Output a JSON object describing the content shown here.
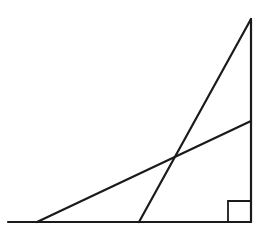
{
  "diagram": {
    "type": "geometry",
    "colors": {
      "stroke": "#1a1a1a",
      "background": "#ffffff"
    },
    "points": {
      "base_left_end": [
        8,
        222
      ],
      "right_angle_vertex": [
        251,
        222
      ],
      "top_vertex": [
        251,
        19
      ],
      "steep_line_base_point": [
        139,
        222
      ],
      "shallow_line_base_point": [
        37,
        222
      ],
      "shallow_line_side_point": [
        251,
        121
      ],
      "intersection": [
        175,
        157
      ]
    },
    "segments": [
      {
        "name": "baseline",
        "from": [
          8,
          222
        ],
        "to": [
          251,
          222
        ]
      },
      {
        "name": "vertical-side",
        "from": [
          251,
          19
        ],
        "to": [
          251,
          222
        ]
      },
      {
        "name": "steep-line",
        "from": [
          139,
          222
        ],
        "to": [
          251,
          19
        ]
      },
      {
        "name": "shallow-line",
        "from": [
          37,
          222
        ],
        "to": [
          251,
          121
        ]
      }
    ],
    "right_angle_marker": {
      "corner": [
        251,
        222
      ],
      "size": 23
    }
  }
}
